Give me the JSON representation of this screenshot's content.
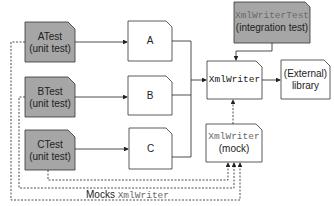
{
  "nodes": {
    "atest": {
      "name": "ATest",
      "sub": "(unit test)"
    },
    "btest": {
      "name": "BTest",
      "sub": "(unit test)"
    },
    "ctest": {
      "name": "CTest",
      "sub": "(unit test)"
    },
    "a": {
      "name": "A"
    },
    "b": {
      "name": "B"
    },
    "c": {
      "name": "C"
    },
    "xmlwriter": {
      "name": "XmlWriter"
    },
    "external": {
      "line1": "(External)",
      "line2": "library"
    },
    "integration": {
      "name": "XmlWriterTest",
      "sub": "(integration test)"
    },
    "mock": {
      "name": "XmlWriter",
      "sub": "(mock)"
    }
  },
  "caption": {
    "prefix": "Mocks ",
    "code": "XmlWriter"
  },
  "colors": {
    "test_fill": "#a6a6a6",
    "box_fill": "#ffffff",
    "line": "#222222"
  }
}
